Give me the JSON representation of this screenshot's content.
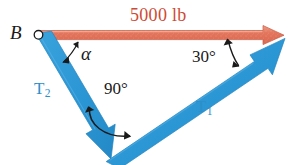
{
  "figure": {
    "type": "force-triangle-vector-diagram",
    "width": 301,
    "height": 165,
    "background": "#ffffff"
  },
  "labels": {
    "point_b": "B",
    "resultant_force": "5000 lb",
    "angle_alpha": "α",
    "angle_90": "90°",
    "angle_30": "30°",
    "tension_2": "T",
    "tension_2_sub": "2",
    "tension_1": "T",
    "tension_1_sub": "1"
  },
  "colors": {
    "resultant_red": "#e0705a",
    "resultant_red_dark": "#cf4a33",
    "vector_blue": "#2b96d4",
    "vector_blue_label": "#2c8fc9",
    "annotation_black": "#1a1a1a",
    "background": "#ffffff"
  },
  "vectors": [
    {
      "name": "resultant-force-vector",
      "label": "5000 lb",
      "color": "#e0705a",
      "magnitude": "5000 lb",
      "direction": "horizontal-right",
      "from": [
        38,
        35
      ],
      "to": [
        283,
        35
      ]
    },
    {
      "name": "tension-t2-vector",
      "label": "T2",
      "color": "#2b96d4",
      "direction": "down-right",
      "from": [
        38,
        35
      ],
      "to": [
        110,
        158
      ]
    },
    {
      "name": "tension-t1-vector",
      "label": "T1",
      "color": "#2b96d4",
      "direction": "up-right",
      "from": [
        110,
        158
      ],
      "to": [
        284,
        40
      ]
    }
  ],
  "angles": [
    {
      "name": "angle-alpha",
      "label": "α",
      "vertex": [
        38,
        35
      ],
      "between": [
        "resultant-force-vector",
        "tension-t2-vector"
      ]
    },
    {
      "name": "angle-90",
      "label": "90°",
      "value": 90,
      "vertex": [
        110,
        158
      ],
      "between": [
        "tension-t2-vector",
        "tension-t1-vector"
      ]
    },
    {
      "name": "angle-30",
      "label": "30°",
      "value": 30,
      "vertex": [
        283,
        37
      ],
      "between": [
        "resultant-force-vector",
        "tension-t1-vector"
      ]
    }
  ],
  "markers": [
    {
      "name": "point-b-marker",
      "shape": "open-circle",
      "at": [
        38,
        35
      ]
    }
  ]
}
